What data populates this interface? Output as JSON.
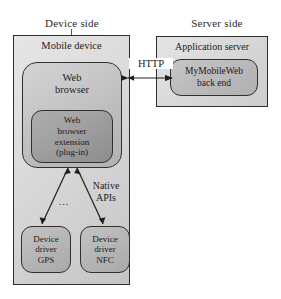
{
  "diagram": {
    "title_device_side": "Device side",
    "title_server_side": "Server side",
    "device": {
      "caption": "Mobile device",
      "browser": {
        "label": "Web\nbrowser",
        "line1": "Web",
        "line2": "browser"
      },
      "extension": {
        "line1": "Web",
        "line2": "browser",
        "line3": "extension",
        "line4": "(plug-in)"
      },
      "native_apis": {
        "line1": "Native",
        "line2": "APIs"
      },
      "ellipsis": "...",
      "drivers": [
        {
          "line1": "Device",
          "line2": "driver",
          "line3": "GPS"
        },
        {
          "line1": "Device",
          "line2": "driver",
          "line3": "NFC"
        }
      ]
    },
    "server": {
      "caption": "Application server",
      "backend": {
        "line1": "MyMobileWeb",
        "line2": "back end"
      }
    },
    "connection": {
      "protocol_label": "HTTP"
    },
    "colors": {
      "stroke": "#2e2e2e",
      "outer_fill": "#dcdcdc",
      "browser_fill": "#c5c5c5",
      "extension_fill": "#a0a0a0",
      "driver_fill": "#b8b8b8",
      "background": "#ffffff"
    }
  }
}
